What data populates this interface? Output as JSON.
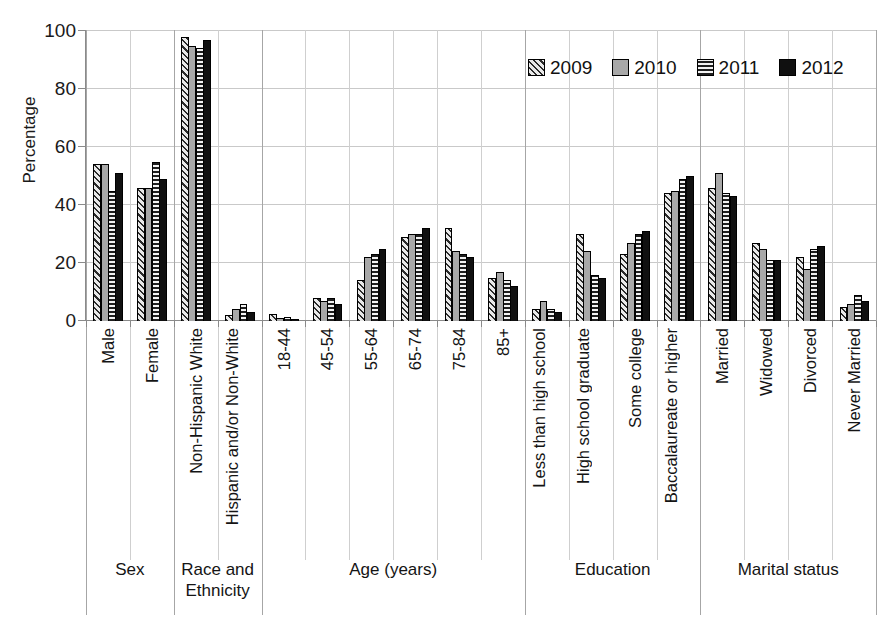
{
  "chart_data": {
    "type": "bar",
    "title": "",
    "subtitle": "",
    "xlabel": "",
    "ylabel": "Percentage",
    "ylim": [
      0,
      100
    ],
    "ytick_labels": [
      "0",
      "20",
      "40",
      "60",
      "80",
      "100"
    ],
    "ytick_values": [
      0,
      20,
      40,
      60,
      80,
      100
    ],
    "grid": true,
    "legend_position": "top-right",
    "categories": [
      "Male",
      "Female",
      "Non-Hispanic White",
      "Hispanic and/or Non-White",
      "18-44",
      "45-54",
      "55-64",
      "65-74",
      "75-84",
      "85+",
      "Less than high school",
      "High school graduate",
      "Some college",
      "Baccalaureate or higher",
      "Married",
      "Widowed",
      "Divorced",
      "Never Married"
    ],
    "group_labels": [
      "Sex",
      "Race and Ethnicity",
      "Age (years)",
      "Education",
      "Marital status"
    ],
    "group_spans": [
      2,
      2,
      6,
      4,
      4
    ],
    "series": [
      {
        "name": "2009",
        "pattern": "diagonal-hatch",
        "color": "#e9e9e9",
        "values": [
          54,
          46,
          98,
          2,
          2.5,
          8,
          14,
          29,
          32,
          15,
          4,
          30,
          23,
          44,
          46,
          27,
          22,
          5
        ]
      },
      {
        "name": "2010",
        "pattern": "solid-gray",
        "color": "#a8a8a8",
        "values": [
          54,
          46,
          95,
          4,
          1,
          7,
          22,
          30,
          24,
          17,
          7,
          24,
          27,
          45,
          51,
          25,
          18,
          6
        ]
      },
      {
        "name": "2011",
        "pattern": "horizontal-lines",
        "color": "#f2f2f2",
        "values": [
          45,
          55,
          94,
          6,
          1.5,
          8,
          23,
          30,
          23,
          14,
          4,
          16,
          30,
          49,
          44,
          21,
          25,
          9
        ]
      },
      {
        "name": "2012",
        "pattern": "solid-black",
        "color": "#101010",
        "values": [
          51,
          49,
          97,
          3,
          0.5,
          6,
          25,
          32,
          22,
          12,
          3,
          15,
          31,
          50,
          43,
          21,
          26,
          7
        ]
      }
    ]
  }
}
